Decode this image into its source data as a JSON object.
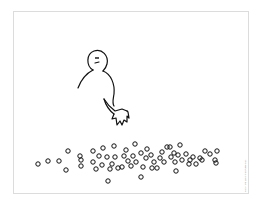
{
  "cartoon": {
    "subject": "stick figure reaching toward a pile of small circles",
    "copyright": "Copyright 2007 The Page Guy",
    "colors": {
      "line": "#111111",
      "frame": "#dcdcdc",
      "background": "#ffffff"
    }
  },
  "figure": {
    "head": {
      "cx": 98,
      "cy": 61,
      "r": 10
    },
    "expression": "neutral"
  },
  "circles": [
    [
      38,
      164
    ],
    [
      48,
      161
    ],
    [
      59,
      161
    ],
    [
      68,
      151
    ],
    [
      66,
      170
    ],
    [
      80,
      156
    ],
    [
      81,
      160
    ],
    [
      81,
      166
    ],
    [
      93,
      151
    ],
    [
      93,
      162
    ],
    [
      96,
      169
    ],
    [
      99,
      156
    ],
    [
      103,
      148
    ],
    [
      102,
      165
    ],
    [
      107,
      157
    ],
    [
      110,
      169
    ],
    [
      112,
      164
    ],
    [
      114,
      146
    ],
    [
      115,
      157
    ],
    [
      118,
      168
    ],
    [
      122,
      167
    ],
    [
      124,
      156
    ],
    [
      126,
      150
    ],
    [
      128,
      161
    ],
    [
      131,
      166
    ],
    [
      133,
      156
    ],
    [
      135,
      144
    ],
    [
      136,
      162
    ],
    [
      141,
      153
    ],
    [
      143,
      167
    ],
    [
      141,
      177
    ],
    [
      146,
      158
    ],
    [
      147,
      149
    ],
    [
      151,
      155
    ],
    [
      152,
      168
    ],
    [
      154,
      162
    ],
    [
      157,
      168
    ],
    [
      160,
      158
    ],
    [
      162,
      152
    ],
    [
      164,
      162
    ],
    [
      167,
      147
    ],
    [
      170,
      147
    ],
    [
      171,
      157
    ],
    [
      174,
      153
    ],
    [
      175,
      162
    ],
    [
      176,
      171
    ],
    [
      178,
      155
    ],
    [
      180,
      145
    ],
    [
      182,
      160
    ],
    [
      186,
      154
    ],
    [
      189,
      164
    ],
    [
      190,
      160
    ],
    [
      193,
      157
    ],
    [
      196,
      164
    ],
    [
      200,
      158
    ],
    [
      202,
      160
    ],
    [
      205,
      151
    ],
    [
      210,
      154
    ],
    [
      215,
      160
    ],
    [
      217,
      151
    ],
    [
      216,
      163
    ],
    [
      108,
      181
    ]
  ]
}
